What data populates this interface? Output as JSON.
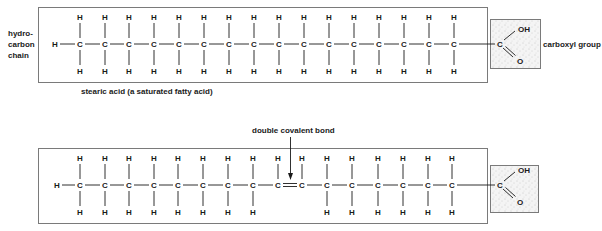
{
  "diagram": {
    "type": "chemical-structure-comparison",
    "saturated": {
      "caption": "stearic acid (a saturated fatty acid)",
      "side_label_lines": [
        "hydro-",
        "carbon",
        "chain"
      ],
      "carboxyl_label": "carboxyl group",
      "terminal_atom": "H",
      "chain_carbon_count": 17,
      "atom_symbols": {
        "carbon": "C",
        "hydrogen": "H",
        "oxygen": "O",
        "hydroxyl": "OH"
      }
    },
    "unsaturated": {
      "annotation": "double covalent bond",
      "terminal_atom": "H",
      "chain_carbon_count": 17,
      "double_bond_between_carbons": [
        9,
        10
      ],
      "atom_symbols": {
        "carbon": "C",
        "hydrogen": "H",
        "oxygen": "O",
        "hydroxyl": "OH"
      }
    },
    "colors": {
      "ink": "#1a1a1a",
      "box_border": "#7a7a7a",
      "carboxyl_fill": "#f2f2f2",
      "stipple": "#9a9a9a"
    }
  }
}
